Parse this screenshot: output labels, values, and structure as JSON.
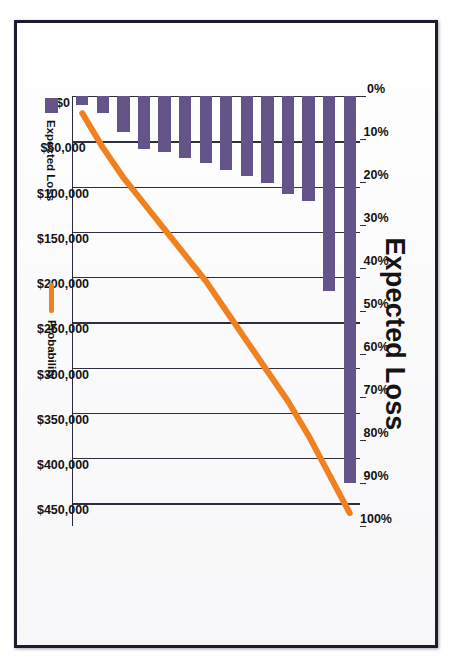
{
  "figure": {
    "title": "Expected Loss",
    "orientation_note": "rotated"
  },
  "legend": {
    "items": [
      {
        "label": "Expected Loss",
        "marker": "bar-swatch",
        "color": "#65548A"
      },
      {
        "label": "Probability",
        "marker": "line-swatch",
        "color": "#F0811E"
      }
    ]
  },
  "colors": {
    "bar": "#65548A",
    "line": "#F0811E",
    "axis": "#2e2e3e",
    "frame": "#1d1b2e",
    "paper": "#fdfdfd",
    "text": "#131313"
  },
  "chart_data": {
    "type": "bar",
    "title": "Expected Loss",
    "xlabel": "",
    "ylabel": "Expected Loss",
    "y2label": "Probability",
    "grid": true,
    "legend_position": "bottom",
    "categories": [
      "1",
      "2",
      "3",
      "4",
      "5",
      "6",
      "7",
      "8",
      "9",
      "10",
      "11",
      "12",
      "13",
      "14"
    ],
    "y_tick_labels": [
      "$0",
      "$50,000",
      "$100,000",
      "$150,000",
      "$200,000",
      "$250,000",
      "$300,000",
      "$350,000",
      "$400,000",
      "$450,000"
    ],
    "y_tick_values": [
      0,
      50000,
      100000,
      150000,
      200000,
      250000,
      300000,
      350000,
      400000,
      450000
    ],
    "ylim": [
      0,
      475000
    ],
    "y2_tick_labels": [
      "0%",
      "10%",
      "20%",
      "30%",
      "40%",
      "50%",
      "60%",
      "70%",
      "80%",
      "90%",
      "100%"
    ],
    "y2_tick_values": [
      0,
      10,
      20,
      30,
      40,
      50,
      60,
      70,
      80,
      90,
      100
    ],
    "y2lim": [
      0,
      100
    ],
    "series": [
      {
        "name": "Expected Loss",
        "type": "bar",
        "color": "#65548A",
        "values": [
          428000,
          215000,
          116000,
          108000,
          96000,
          88000,
          82000,
          74000,
          68000,
          62000,
          58000,
          40000,
          19000,
          10000
        ]
      },
      {
        "name": "Probability",
        "type": "line",
        "color": "#F0811E",
        "values": [
          97,
          88,
          79,
          71,
          64,
          57,
          50,
          43,
          37,
          31,
          25,
          19,
          12,
          4
        ]
      }
    ]
  }
}
